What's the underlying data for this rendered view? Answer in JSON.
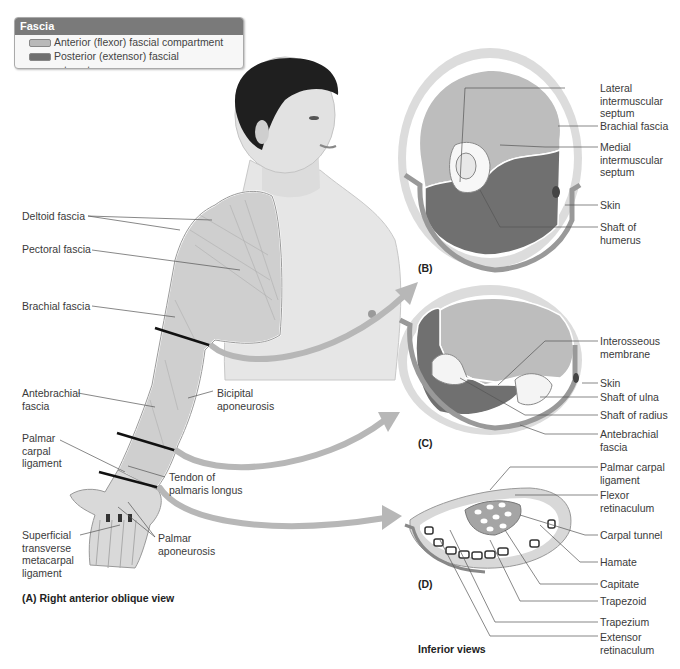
{
  "legend": {
    "title": "Fascia",
    "items": [
      {
        "label": "Anterior (flexor) fascial compartment",
        "color": "#b9b9b9"
      },
      {
        "label": "Posterior (extensor) fascial compartment",
        "color": "#6f6f6f"
      }
    ]
  },
  "panel_a": {
    "caption": "(A) Right anterior oblique view",
    "labels": {
      "deltoid_fascia": "Deltoid fascia",
      "pectoral_fascia": "Pectoral fascia",
      "brachial_fascia": "Brachial fascia",
      "antebrachial_fascia": [
        "Antebrachial",
        "fascia"
      ],
      "bicipital_aponeurosis": [
        "Bicipital",
        "aponeurosis"
      ],
      "palmar_carpal_ligament": [
        "Palmar",
        "carpal",
        "ligament"
      ],
      "tendon_palmaris_longus": [
        "Tendon of",
        "palmaris longus"
      ],
      "superficial_transverse_metacarpal_ligament": [
        "Superficial",
        "transverse",
        "metacarpal",
        "ligament"
      ],
      "palmar_aponeurosis": [
        "Palmar",
        "aponeurosis"
      ]
    }
  },
  "panel_b": {
    "caption": "(B)",
    "labels": {
      "lateral_intermuscular_septum": [
        "Lateral",
        "intermuscular",
        "septum"
      ],
      "brachial_fascia": "Brachial fascia",
      "medial_intermuscular_septum": [
        "Medial",
        "intermuscular",
        "septum"
      ],
      "skin": "Skin",
      "shaft_of_humerus": [
        "Shaft of",
        "humerus"
      ]
    }
  },
  "panel_c": {
    "caption": "(C)",
    "labels": {
      "interosseous_membrane": [
        "Interosseous",
        "membrane"
      ],
      "skin": "Skin",
      "shaft_of_ulna": "Shaft of ulna",
      "shaft_of_radius": "Shaft of radius",
      "antebrachial_fascia": [
        "Antebrachial",
        "fascia"
      ]
    }
  },
  "panel_d": {
    "caption": "(D)",
    "footer": "Inferior views",
    "labels": {
      "palmar_carpal_ligament": [
        "Palmar carpal",
        "ligament"
      ],
      "flexor_retinaculum": [
        "Flexor",
        "retinaculum"
      ],
      "carpal_tunnel": "Carpal tunnel",
      "hamate": "Hamate",
      "capitate": "Capitate",
      "trapezoid": "Trapezoid",
      "trapezium": "Trapezium",
      "extensor_retinaculum": [
        "Extensor",
        "retinaculum"
      ]
    }
  }
}
